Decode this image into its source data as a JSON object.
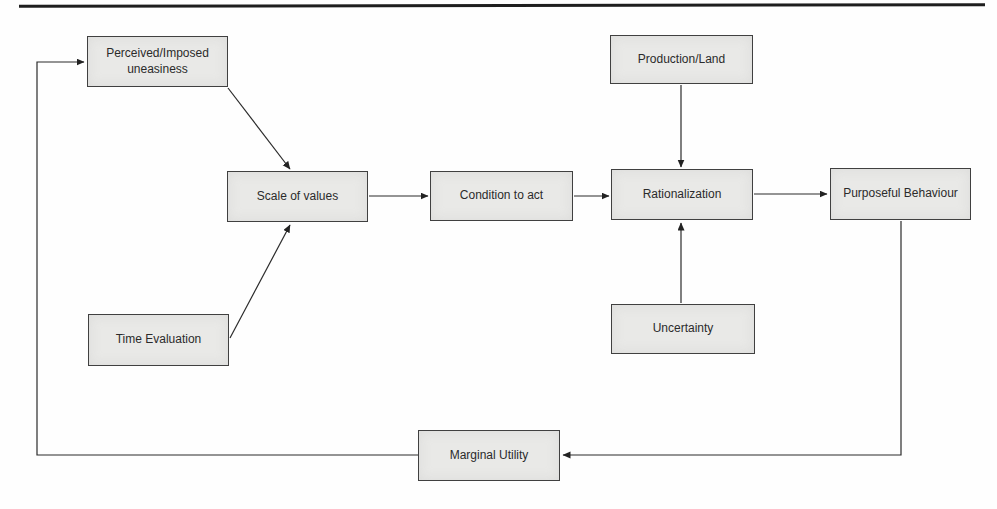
{
  "page": {
    "background": "#fefefe",
    "top_rule_color": "#1e1e1e"
  },
  "diagram": {
    "node_fill": "#e9e9e7",
    "node_border": "#404040",
    "text_color": "#2b2b2b",
    "nodes": {
      "perceived": {
        "label": "Perceived/Imposed uneasiness"
      },
      "time": {
        "label": "Time Evaluation"
      },
      "scale": {
        "label": "Scale of values"
      },
      "condition": {
        "label": "Condition to act"
      },
      "production": {
        "label": "Production/Land"
      },
      "rational": {
        "label": "Rationalization"
      },
      "uncertainty": {
        "label": "Uncertainty"
      },
      "purposeful": {
        "label": "Purposeful Behaviour"
      },
      "marginal": {
        "label": "Marginal Utility"
      }
    },
    "edges": [
      {
        "from": "Perceived/Imposed uneasiness",
        "to": "Scale of values"
      },
      {
        "from": "Time Evaluation",
        "to": "Scale of values"
      },
      {
        "from": "Scale of values",
        "to": "Condition to act"
      },
      {
        "from": "Condition to act",
        "to": "Rationalization"
      },
      {
        "from": "Production/Land",
        "to": "Rationalization"
      },
      {
        "from": "Uncertainty",
        "to": "Rationalization"
      },
      {
        "from": "Rationalization",
        "to": "Purposeful Behaviour"
      },
      {
        "from": "Purposeful Behaviour",
        "to": "Marginal Utility"
      },
      {
        "from": "Marginal Utility",
        "to": "Perceived/Imposed uneasiness"
      }
    ]
  }
}
